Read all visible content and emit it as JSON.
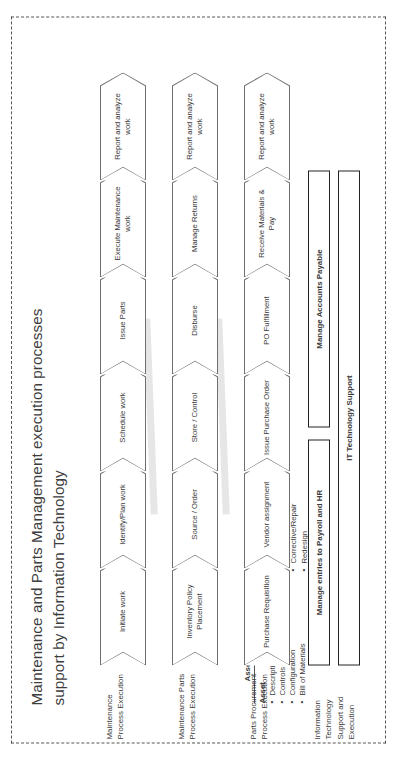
{
  "title": "Maintenance and Parts Management execution processes support by Information Technology",
  "callouts": [
    {
      "id": "assets",
      "heading": "Assets/Hierarchies",
      "subheading": "Asset",
      "items": [
        "Descriptions/ Classifications",
        "Controls",
        "Configuration",
        "Bill of Materials"
      ]
    },
    {
      "id": "actions",
      "heading": "Actions Requiring work",
      "subheading": "",
      "items": [
        "Predictive",
        "Preventive",
        "Inspection",
        "Corrective/Repair",
        "Redesign"
      ]
    }
  ],
  "rows": [
    {
      "label": "Maintenance Process Execution",
      "steps": [
        "Initiate work",
        "Identify/Plan work",
        "Schedule work",
        "Issue Parts",
        "Execute Maintenance work",
        "Report and analyze work"
      ]
    },
    {
      "label": "Maintenance Parts Process Execution",
      "steps": [
        "Inventory Policy Placement",
        "Source / Order",
        "Store / Control",
        "Disburse",
        "Manage Returns",
        "Report and analyze work"
      ]
    },
    {
      "label": "Parts Procurement Process Execution",
      "steps": [
        "Purchase Requisition",
        "Vendor assignment",
        "Issue Purchase Order",
        "PO Fulfillment",
        "Receive Materials & Pay",
        "Report and analyze work"
      ]
    }
  ],
  "it_row": {
    "label": "Information Technology Support and Execution",
    "bars_top": [
      "Manage entries to Payroll and HR",
      "Manage Accounts Payable"
    ],
    "bar_bottom": "IT Technology Support"
  },
  "colors": {
    "frame": "#555555",
    "chevron_outline": "#6f6f6f",
    "bar_outline": "#222222",
    "text": "#3a3a3a",
    "stripe": "#e2e2e2"
  }
}
